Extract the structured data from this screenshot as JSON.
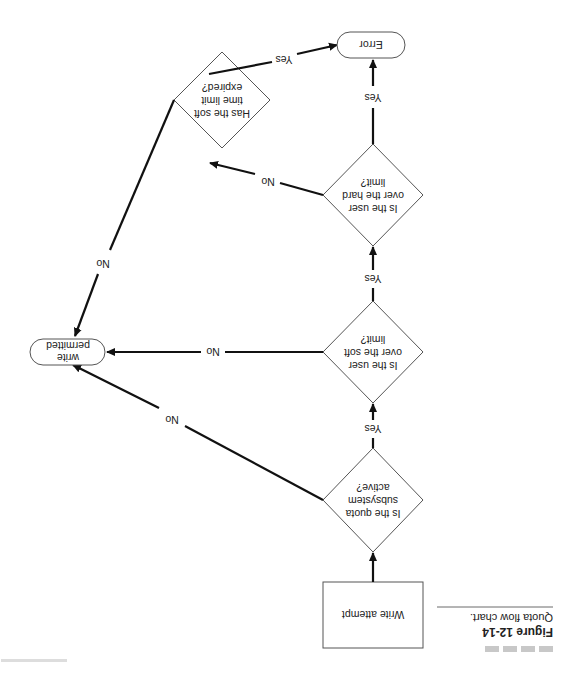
{
  "orientation": "rotated-180",
  "figure": {
    "number": "Figure 12-14",
    "caption": "Quota flow chart."
  },
  "nodes": {
    "start": {
      "type": "process",
      "label": "Write attempt"
    },
    "quota_active": {
      "type": "decision",
      "lines": [
        "Is the quota",
        "subsystem",
        "active?"
      ]
    },
    "over_soft": {
      "type": "decision",
      "lines": [
        "Is the user",
        "over the soft",
        "limit?"
      ]
    },
    "over_hard": {
      "type": "decision",
      "lines": [
        "Is the user",
        "over the hard",
        "limit?"
      ]
    },
    "soft_expired": {
      "type": "decision",
      "lines": [
        "Has the soft",
        "time limit",
        "expired?"
      ]
    },
    "error": {
      "type": "terminal",
      "label": "Error"
    },
    "permitted": {
      "type": "terminal",
      "lines": [
        "write",
        "permitted"
      ]
    }
  },
  "edges": [
    {
      "from": "start",
      "to": "quota_active",
      "label": ""
    },
    {
      "from": "quota_active",
      "to": "over_soft",
      "label": "Yes"
    },
    {
      "from": "quota_active",
      "to": "permitted",
      "label": "No"
    },
    {
      "from": "over_soft",
      "to": "over_hard",
      "label": "Yes"
    },
    {
      "from": "over_soft",
      "to": "permitted",
      "label": "No"
    },
    {
      "from": "over_hard",
      "to": "error",
      "label": "Yes"
    },
    {
      "from": "over_hard",
      "to": "soft_expired",
      "label": "No"
    },
    {
      "from": "soft_expired",
      "to": "error",
      "label": "Yes"
    },
    {
      "from": "soft_expired",
      "to": "permitted",
      "label": "No"
    }
  ],
  "colors": {
    "edge": "#111111",
    "shape_stroke": "#555555",
    "caption_bar": "#c8c8c8"
  }
}
